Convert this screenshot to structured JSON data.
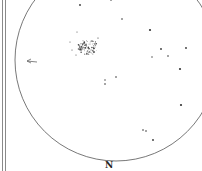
{
  "sketch": {
    "type": "eyepiece-drawing",
    "field_circle": {
      "cx": 116,
      "cy": 60,
      "r": 101,
      "stroke": "#555555"
    },
    "orientation_label": {
      "text": "N",
      "x": 105,
      "y": 160
    },
    "direction_arrow": {
      "x1": 37,
      "y1": 62,
      "x2": 27,
      "y2": 61,
      "color": "#666666"
    },
    "cluster": {
      "cx": 88,
      "cy": 47,
      "rx": 10,
      "ry": 8
    },
    "stars": [
      {
        "x": 80,
        "y": 5,
        "r": 0.9
      },
      {
        "x": 111,
        "y": 0,
        "r": 0.8
      },
      {
        "x": 122,
        "y": 19,
        "r": 0.8
      },
      {
        "x": 150,
        "y": 30,
        "r": 1.1
      },
      {
        "x": 161,
        "y": 49,
        "r": 0.9
      },
      {
        "x": 152,
        "y": 57,
        "r": 0.7
      },
      {
        "x": 168,
        "y": 56,
        "r": 0.8
      },
      {
        "x": 186,
        "y": 48,
        "r": 0.9
      },
      {
        "x": 180,
        "y": 69,
        "r": 1.1
      },
      {
        "x": 181,
        "y": 105,
        "r": 1.1
      },
      {
        "x": 143,
        "y": 130,
        "r": 0.8
      },
      {
        "x": 146,
        "y": 131,
        "r": 0.8
      },
      {
        "x": 153,
        "y": 140,
        "r": 0.9
      },
      {
        "x": 105,
        "y": 80,
        "r": 0.7
      },
      {
        "x": 105,
        "y": 84,
        "r": 0.8
      },
      {
        "x": 116,
        "y": 77,
        "r": 0.8
      },
      {
        "x": 77,
        "y": 32,
        "r": 0.5
      },
      {
        "x": 70,
        "y": 42,
        "r": 0.5
      },
      {
        "x": 98,
        "y": 38,
        "r": 0.6
      },
      {
        "x": 72,
        "y": 50,
        "r": 0.5
      },
      {
        "x": 76,
        "y": 55,
        "r": 0.5
      }
    ],
    "frame_lines_x": [
      2,
      5
    ]
  }
}
